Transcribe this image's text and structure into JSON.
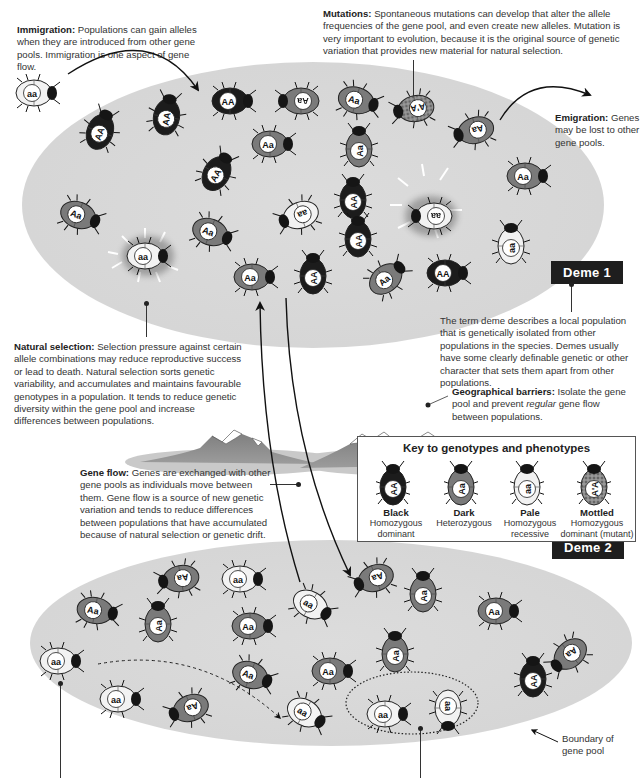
{
  "annotations": {
    "immigration": {
      "title": "Immigration:",
      "body": " Populations can gain alleles when they are introduced from other gene pools. Immigration is one aspect of gene flow."
    },
    "mutations": {
      "title": "Mutations:",
      "body": " Spontaneous mutations can develop that alter the allele frequencies of the gene pool, and even create new alleles. Mutation is very important to evolution, because it is the original source of genetic variation that provides new material for natural selection."
    },
    "emigration": {
      "title": "Emigration:",
      "body": " Genes may be lost to other gene pools."
    },
    "natural_selection": {
      "title": "Natural selection:",
      "body": " Selection pressure against certain allele combinations may reduce reproductive success or lead to death. Natural selection sorts genetic variability, and accumulates and maintains favourable genotypes in a population. It tends to reduce genetic diversity within the gene pool and increase differences between populations."
    },
    "deme_definition": {
      "body": "The term deme describes a local population that is genetically isolated from other populations in the species. Demes usually have some clearly definable genetic or other character that sets them apart from other populations."
    },
    "geographical_barriers": {
      "title": "Geographical barriers:",
      "body": " Isolate the gene pool and prevent ",
      "italic": "regular",
      "body2": " gene flow between populations."
    },
    "gene_flow": {
      "title": "Gene flow:",
      "body": " Genes are exchanged with other gene pools as individuals move between them. Gene flow is a source of new genetic variation and tends to reduce differences between populations that have accumulated because of natural selection or genetic drift."
    },
    "boundary": {
      "body": "Boundary of gene pool"
    }
  },
  "demes": {
    "deme1": {
      "label": "Deme 1"
    },
    "deme2": {
      "label": "Deme 2"
    }
  },
  "key": {
    "title": "Key to genotypes and phenotypes",
    "items": [
      {
        "genotype": "AA",
        "name": "Black",
        "desc": "Homozygous dominant",
        "type": "black"
      },
      {
        "genotype": "Aa",
        "name": "Dark",
        "desc": "Heterozygous",
        "type": "dark"
      },
      {
        "genotype": "aa",
        "name": "Pale",
        "desc": "Homozygous recessive",
        "type": "pale"
      },
      {
        "genotype": "A'A",
        "name": "Mottled",
        "desc": "Homozygous dominant (mutant)",
        "type": "mottled"
      }
    ]
  },
  "colors": {
    "black": "#1c1c1c",
    "dark": "#7a7a7a",
    "pale": "#f2f2f2",
    "mottled": "#8c8c8c",
    "pool": "#d8d8d8",
    "label_bg": "#1e1e1e"
  },
  "beetles": {
    "immigrant": [
      {
        "g": "aa",
        "t": "pale",
        "x": 14,
        "y": 82,
        "r": 0
      }
    ],
    "deme1": [
      {
        "g": "AA",
        "t": "black",
        "x": 210,
        "y": 90,
        "r": 0
      },
      {
        "g": "Aa",
        "t": "dark",
        "x": 275,
        "y": 90,
        "r": 180
      },
      {
        "g": "AA",
        "t": "black",
        "x": 144,
        "y": 103,
        "r": -80
      },
      {
        "g": "Aa",
        "t": "dark",
        "x": 336,
        "y": 90,
        "r": 15
      },
      {
        "g": "A'A",
        "t": "mottled",
        "x": 390,
        "y": 98,
        "r": 170
      },
      {
        "g": "AA",
        "t": "black",
        "x": 78,
        "y": 118,
        "r": -70
      },
      {
        "g": "Aa",
        "t": "dark",
        "x": 250,
        "y": 133,
        "r": 0
      },
      {
        "g": "Aa",
        "t": "dark",
        "x": 336,
        "y": 135,
        "r": -90
      },
      {
        "g": "Aa",
        "t": "dark",
        "x": 450,
        "y": 120,
        "r": 165
      },
      {
        "g": "AA",
        "t": "black",
        "x": 195,
        "y": 160,
        "r": -60
      },
      {
        "g": "AA",
        "t": "black",
        "x": 330,
        "y": 186,
        "r": -90
      },
      {
        "g": "aa",
        "t": "pale",
        "x": 408,
        "y": 205,
        "r": 180,
        "selected": true
      },
      {
        "g": "Aa",
        "t": "dark",
        "x": 505,
        "y": 165,
        "r": 0
      },
      {
        "g": "Aa",
        "t": "dark",
        "x": 58,
        "y": 205,
        "r": 20
      },
      {
        "g": "Aa",
        "t": "dark",
        "x": 190,
        "y": 222,
        "r": 20
      },
      {
        "g": "aa",
        "t": "pale",
        "x": 275,
        "y": 205,
        "r": 160
      },
      {
        "g": "aa",
        "t": "pale",
        "x": 125,
        "y": 245,
        "r": 0,
        "selected": true
      },
      {
        "g": "AA",
        "t": "black",
        "x": 335,
        "y": 225,
        "r": -90
      },
      {
        "g": "aa",
        "t": "pale",
        "x": 488,
        "y": 232,
        "r": -90
      },
      {
        "g": "Aa",
        "t": "dark",
        "x": 232,
        "y": 266,
        "r": 0
      },
      {
        "g": "AA",
        "t": "black",
        "x": 290,
        "y": 262,
        "r": -90
      },
      {
        "g": "Aa",
        "t": "dark",
        "x": 365,
        "y": 266,
        "r": -40
      },
      {
        "g": "AA",
        "t": "black",
        "x": 425,
        "y": 262,
        "r": 0
      }
    ],
    "deme2": [
      {
        "g": "Aa",
        "t": "dark",
        "x": 155,
        "y": 568,
        "r": 170
      },
      {
        "g": "aa",
        "t": "pale",
        "x": 220,
        "y": 568,
        "r": 0
      },
      {
        "g": "Aa",
        "t": "dark",
        "x": 75,
        "y": 600,
        "r": 10
      },
      {
        "g": "Aa",
        "t": "dark",
        "x": 135,
        "y": 610,
        "r": -90
      },
      {
        "g": "Aa",
        "t": "dark",
        "x": 230,
        "y": 615,
        "r": 0
      },
      {
        "g": "aa",
        "t": "pale",
        "x": 290,
        "y": 595,
        "r": 30
      },
      {
        "g": "Aa",
        "t": "dark",
        "x": 350,
        "y": 568,
        "r": 160
      },
      {
        "g": "Aa",
        "t": "dark",
        "x": 400,
        "y": 580,
        "r": -90
      },
      {
        "g": "Aa",
        "t": "dark",
        "x": 476,
        "y": 600,
        "r": 0
      },
      {
        "g": "Aa",
        "t": "dark",
        "x": 372,
        "y": 640,
        "r": -90
      },
      {
        "g": "aa",
        "t": "pale",
        "x": 38,
        "y": 650,
        "r": 0
      },
      {
        "g": "Aa",
        "t": "dark",
        "x": 230,
        "y": 665,
        "r": 20
      },
      {
        "g": "Aa",
        "t": "dark",
        "x": 310,
        "y": 660,
        "r": 0
      },
      {
        "g": "aa",
        "t": "pale",
        "x": 98,
        "y": 688,
        "r": 0
      },
      {
        "g": "Aa",
        "t": "dark",
        "x": 165,
        "y": 698,
        "r": 160
      },
      {
        "g": "aa",
        "t": "pale",
        "x": 284,
        "y": 703,
        "r": 30
      },
      {
        "g": "aa",
        "t": "pale",
        "x": 365,
        "y": 703,
        "r": 0
      },
      {
        "g": "aa",
        "t": "pale",
        "x": 425,
        "y": 700,
        "r": 90
      },
      {
        "g": "Aa",
        "t": "dark",
        "x": 545,
        "y": 645,
        "r": 140
      },
      {
        "g": "AA",
        "t": "black",
        "x": 510,
        "y": 665,
        "r": -90
      }
    ]
  }
}
